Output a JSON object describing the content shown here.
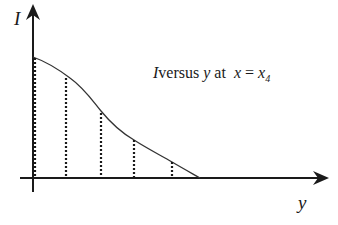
{
  "diagram": {
    "axes": {
      "vertical_label": "I",
      "horizontal_label": "y"
    },
    "caption": {
      "var": "I",
      "versus": "versus",
      "yvar": "y",
      "at": "at",
      "x": "x",
      "eq": "=",
      "xsub_base": "x",
      "xsub_index": "4"
    },
    "curve": {
      "description": "Decreasing curve of I with y, starting on the I-axis and reaching zero on the y-axis",
      "points_px": [
        [
          33,
          57
        ],
        [
          66,
          77
        ],
        [
          101,
          113
        ],
        [
          134,
          140
        ],
        [
          172,
          162
        ],
        [
          200,
          178
        ]
      ]
    },
    "dashed_ordinates_count": 5,
    "colors": {
      "line": "#1a1a1a",
      "curve": "#333333",
      "background": "#ffffff"
    }
  }
}
